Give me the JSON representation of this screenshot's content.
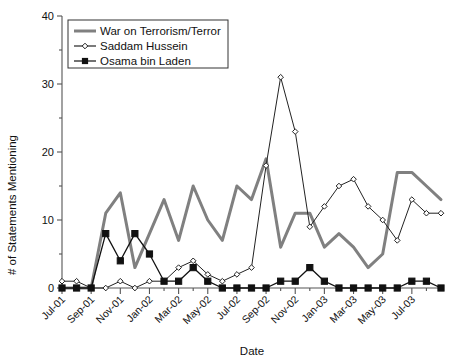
{
  "chart_data": {
    "type": "line",
    "title": "",
    "xlabel": "Date",
    "ylabel": "# of Statements Mentioning",
    "ylim": [
      0,
      40
    ],
    "ymajor_ticks": [
      0,
      10,
      20,
      30,
      40
    ],
    "yminor_ticks": [
      5,
      15,
      25,
      35
    ],
    "grid": false,
    "legend_position": "top-left",
    "x": [
      "Jul-01",
      "Aug-01",
      "Sep-01",
      "Oct-01",
      "Nov-01",
      "Dec-01",
      "Jan-02",
      "Feb-02",
      "Mar-02",
      "Apr-02",
      "May-02",
      "Jun-02",
      "Jul-02",
      "Aug-02",
      "Sep-02",
      "Oct-02",
      "Nov-02",
      "Dec-02",
      "Jan-03",
      "Feb-03",
      "Mar-03",
      "Apr-03",
      "May-03",
      "Jun-03",
      "Jul-03",
      "Aug-03",
      "Sep-03"
    ],
    "xtick_labels": [
      "Jul-01",
      "Sep-01",
      "Nov-01",
      "Jan-02",
      "Mar-02",
      "May-02",
      "Jul-02",
      "Sep-02",
      "Nov-02",
      "Jan-03",
      "Mar-03",
      "May-03",
      "Jul-03"
    ],
    "xtick_indices": [
      0,
      2,
      4,
      6,
      8,
      10,
      12,
      14,
      16,
      18,
      20,
      22,
      24
    ],
    "series": [
      {
        "name": "War on Terrorism/Terror",
        "color": "#808080",
        "marker": "none",
        "line_width": 3,
        "values": [
          0,
          0,
          0,
          11,
          14,
          3,
          8,
          13,
          7,
          15,
          10,
          7,
          15,
          13,
          19,
          6,
          11,
          11,
          6,
          8,
          6,
          3,
          5,
          17,
          17,
          15,
          13
        ]
      },
      {
        "name": "Saddam Hussein",
        "color": "#222222",
        "marker": "diamond-open",
        "line_width": 1,
        "values": [
          1,
          1,
          0,
          0,
          1,
          0,
          1,
          1,
          3,
          4,
          2,
          1,
          2,
          3,
          18,
          31,
          23,
          9,
          12,
          15,
          16,
          12,
          10,
          7,
          13,
          11,
          11
        ]
      },
      {
        "name": "Osama bin Laden",
        "color": "#111111",
        "marker": "square-filled",
        "line_width": 1.3,
        "values": [
          0,
          0,
          0,
          8,
          4,
          8,
          5,
          1,
          1,
          3,
          1,
          0,
          0,
          0,
          0,
          1,
          1,
          3,
          1,
          0,
          0,
          0,
          0,
          0,
          1,
          1,
          0
        ]
      }
    ]
  },
  "legend": {
    "items": [
      {
        "label": "War on Terrorism/Terror",
        "marker": "none",
        "color": "#808080"
      },
      {
        "label": "Saddam Hussein",
        "marker": "diamond-open",
        "color": "#222222"
      },
      {
        "label": "Osama bin Laden",
        "marker": "square-filled",
        "color": "#111111"
      }
    ]
  },
  "axis": {
    "x_title": "Date",
    "y_title": "# of Statements Mentioning"
  }
}
